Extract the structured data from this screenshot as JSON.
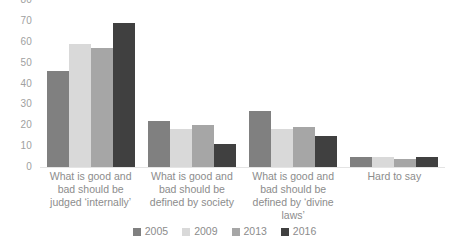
{
  "chart_data": {
    "type": "bar",
    "title": "",
    "subtitle": "",
    "xlabel": "",
    "ylabel": "",
    "ylim": [
      0,
      80
    ],
    "ytick_step": 10,
    "yticks": [
      "80",
      "70",
      "60",
      "50",
      "40",
      "30",
      "20",
      "10",
      "0"
    ],
    "grid": false,
    "legend_position": "bottom-center",
    "value_labels": true,
    "orientation": "vertical",
    "categories": [
      "What is good and bad should be judged ‘internally’",
      "What is good and bad should be defined by society",
      "What is good and bad should be defined by ‘divine laws’",
      "Hard to say"
    ],
    "series": [
      {
        "name": "2005",
        "color": "#808080",
        "values": [
          46,
          22,
          27,
          5
        ]
      },
      {
        "name": "2009",
        "color": "#d9d9d9",
        "values": [
          59,
          18,
          18,
          5
        ]
      },
      {
        "name": "2013",
        "color": "#a6a6a6",
        "values": [
          57,
          20,
          19,
          4
        ]
      },
      {
        "name": "2016",
        "color": "#404040",
        "values": [
          69,
          11,
          15,
          5
        ]
      }
    ]
  },
  "legend": {
    "items": [
      {
        "label": "2005",
        "color": "#808080"
      },
      {
        "label": "2009",
        "color": "#d9d9d9"
      },
      {
        "label": "2013",
        "color": "#a6a6a6"
      },
      {
        "label": "2016",
        "color": "#404040"
      }
    ]
  },
  "axis": {
    "text_color": "#8c8c8c",
    "baseline_color": "#e4e4e4"
  }
}
